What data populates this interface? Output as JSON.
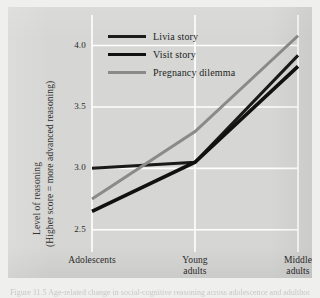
{
  "figure": {
    "background_color": "#d6d6d4",
    "grid_color": "#ffffff",
    "caption_partial": "Figure 11.5  Age-related change in social-cognitive reasoning across adolescence and adulthood"
  },
  "chart_data": {
    "type": "line",
    "title": "",
    "xlabel": "",
    "ylabel": "Level of reasoning (Higher score = more advanced reasoning)",
    "categories": [
      "Adolescents",
      "Young adults",
      "Middle adults"
    ],
    "category_lines": [
      [
        "Adolescents"
      ],
      [
        "Young",
        "adults"
      ],
      [
        "Middle",
        "adults"
      ]
    ],
    "yticks": [
      "2.5",
      "3.0",
      "3.5",
      "4.0"
    ],
    "ytick_values": [
      2.5,
      3.0,
      3.5,
      4.0
    ],
    "ylim": [
      2.4,
      4.2
    ],
    "grid": "horizontal-and-vertical",
    "legend_position": "top-center",
    "series": [
      {
        "name": "Livia story",
        "values": [
          3.0,
          3.05,
          3.92
        ],
        "color": "#1a1a1a",
        "width": 3.0
      },
      {
        "name": "Visit story",
        "values": [
          2.65,
          3.05,
          3.83
        ],
        "color": "#111111",
        "width": 3.6
      },
      {
        "name": "Pregnancy dilemma",
        "values": [
          2.75,
          3.3,
          4.08
        ],
        "color": "#8a8a88",
        "width": 3.0
      }
    ]
  },
  "yaxis_title": {
    "line1": "Level of reasoning",
    "line2": "(Higher score = more advanced reasoning)"
  }
}
